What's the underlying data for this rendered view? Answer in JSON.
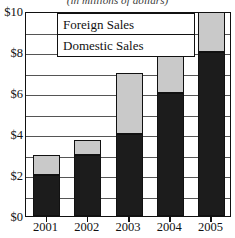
{
  "chart_data": {
    "type": "bar",
    "stacked": true,
    "title": "",
    "subtitle": "(in millions of dollars)",
    "xlabel": "",
    "ylabel": "",
    "categories": [
      "2001",
      "2002",
      "2003",
      "2004",
      "2005"
    ],
    "series": [
      {
        "name": "Domestic Sales",
        "color": "#1c1c1c",
        "values": [
          2,
          3,
          4,
          6,
          8
        ]
      },
      {
        "name": "Foreign Sales",
        "color": "#c9c9c9",
        "values": [
          1,
          0.7,
          3,
          3,
          2
        ]
      }
    ],
    "totals": [
      3,
      3.7,
      7,
      9,
      10
    ],
    "ylim": [
      0,
      10
    ],
    "yticks": [
      0,
      2,
      4,
      6,
      8,
      10
    ],
    "ytick_labels": [
      "$0",
      "$2",
      "$4",
      "$6",
      "$8",
      "$10"
    ],
    "gridlines_at": [
      1,
      2,
      3,
      4,
      5,
      6,
      7,
      8,
      9
    ],
    "grid": true,
    "legend_position": "top-center",
    "legend": [
      {
        "label": "Foreign Sales",
        "color": "#c9c9c9"
      },
      {
        "label": "Domestic Sales",
        "color": "#1c1c1c"
      }
    ],
    "axis_color": "#111111",
    "grid_color": "#555555",
    "background": "#ffffff"
  }
}
